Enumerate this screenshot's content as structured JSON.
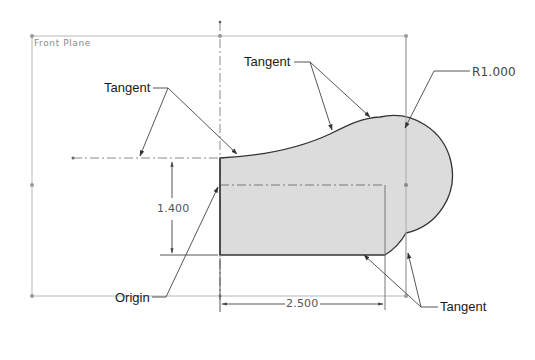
{
  "diagram": {
    "type": "cad-sketch",
    "plane_label": "Front Plane",
    "callouts": {
      "tangent_left": "Tangent",
      "tangent_top": "Tangent",
      "tangent_bottom": "Tangent",
      "origin": "Origin",
      "radius": "R1.000"
    },
    "dimensions": {
      "height": "1.400",
      "width": "2.500"
    },
    "colors": {
      "fill": "#d9d9d9",
      "outline": "#333333",
      "construction": "#9a9a9a",
      "leader": "#444444",
      "plane_frame": "#b5b5b5"
    }
  }
}
